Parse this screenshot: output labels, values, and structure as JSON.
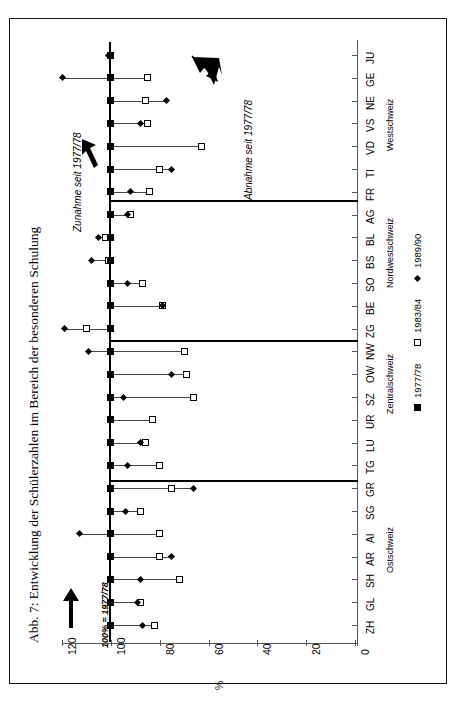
{
  "figure": {
    "title": "Abb. 7: Entwicklung der Schülerzahlen im Bereich der besonderen Schulung",
    "orientation": "rotated-90",
    "base_note": "100% = 1977/78",
    "annotation_increase": "Zunahme seit 1977/78",
    "annotation_decrease": "Abnahme seit 1977/78",
    "percent_symbol": "%"
  },
  "legend": {
    "position": "bottom-right",
    "items": [
      {
        "marker": "filled-square",
        "label": "1977/78"
      },
      {
        "marker": "open-square",
        "label": "1983/84"
      },
      {
        "marker": "filled-diamond",
        "label": "1989/90"
      }
    ]
  },
  "axis": {
    "value_label": "%",
    "ticks": [
      "120",
      "100",
      "80",
      "60",
      "40",
      "20",
      "0"
    ],
    "tick_values": [
      120,
      100,
      80,
      60,
      40,
      20,
      0
    ],
    "min": 0,
    "max": 130
  },
  "regions": [
    {
      "name": "Ostschweiz",
      "cantons": [
        "ZH",
        "GL",
        "SH",
        "AR",
        "AI",
        "SG",
        "GR",
        "TG"
      ]
    },
    {
      "name": "Zentralschweiz",
      "cantons": [
        "LU",
        "UR",
        "SZ",
        "OW",
        "NW",
        "ZG"
      ]
    },
    {
      "name": "Nordwestschweiz",
      "cantons": [
        "BE",
        "SO",
        "BS",
        "BL",
        "AG"
      ]
    },
    {
      "name": "Westschweiz",
      "cantons": [
        "FR",
        "TI",
        "VD",
        "VS",
        "NE",
        "GE",
        "JU"
      ]
    }
  ],
  "chart_data": {
    "type": "scatter",
    "title": "Abb. 7: Entwicklung der Schülerzahlen im Bereich der besonderen Schulung",
    "xlabel": "",
    "ylabel": "%",
    "ylim": [
      0,
      130
    ],
    "grid": false,
    "legend_position": "bottom-right",
    "categories": [
      "ZH",
      "GL",
      "SH",
      "AR",
      "AI",
      "SG",
      "GR",
      "TG",
      "LU",
      "UR",
      "SZ",
      "OW",
      "NW",
      "ZG",
      "BE",
      "SO",
      "BS",
      "BL",
      "AG",
      "FR",
      "TI",
      "VD",
      "VS",
      "NE",
      "GE",
      "JU"
    ],
    "series": [
      {
        "name": "1977/78",
        "marker": "filled-square",
        "values": [
          100,
          100,
          100,
          100,
          100,
          100,
          100,
          100,
          100,
          100,
          100,
          100,
          100,
          100,
          100,
          100,
          100,
          100,
          100,
          100,
          100,
          100,
          100,
          100,
          100,
          100
        ]
      },
      {
        "name": "1983/84",
        "marker": "open-square",
        "values": [
          82,
          88,
          72,
          80,
          80,
          88,
          75,
          80,
          86,
          83,
          66,
          69,
          70,
          110,
          79,
          87,
          101,
          102,
          92,
          84,
          80,
          63,
          85,
          86,
          85,
          100
        ]
      },
      {
        "name": "1989/90",
        "marker": "filled-diamond",
        "values": [
          87,
          89,
          88,
          75,
          113,
          94,
          66,
          93,
          88,
          100,
          95,
          75,
          109,
          119,
          79,
          93,
          108,
          105,
          93,
          92,
          75,
          100,
          88,
          77,
          120,
          101
        ]
      }
    ]
  }
}
